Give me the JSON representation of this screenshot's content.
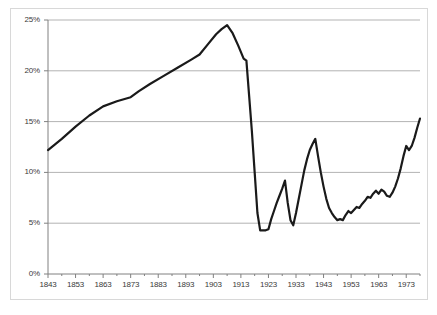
{
  "chart_data": {
    "type": "line",
    "title": "",
    "subtitle": "",
    "xlabel": "",
    "ylabel": "",
    "xlim": [
      1843,
      1978
    ],
    "ylim": [
      0,
      25
    ],
    "grid": true,
    "grid_axis": "y",
    "legend": false,
    "legend_position": "none",
    "line_color": "#1a1a1a",
    "grid_color": "#b3b3b3",
    "axis_color": "#808080",
    "background_color": "#ffffff",
    "y_ticks": [
      0,
      5,
      10,
      15,
      20,
      25
    ],
    "y_tick_labels": [
      "0%",
      "5%",
      "10%",
      "15%",
      "20%",
      "25%"
    ],
    "x_ticks": [
      1843,
      1853,
      1863,
      1873,
      1883,
      1893,
      1903,
      1913,
      1923,
      1933,
      1943,
      1953,
      1963,
      1973
    ],
    "x_tick_labels": [
      "1843",
      "1853",
      "1863",
      "1873",
      "1883",
      "1893",
      "1903",
      "1913",
      "1923",
      "1933",
      "1943",
      "1953",
      "1963",
      "1973"
    ],
    "x_minor_tick_interval": 5,
    "series": [
      {
        "name": "share",
        "x": [
          1843,
          1848,
          1853,
          1858,
          1863,
          1868,
          1873,
          1876,
          1880,
          1885,
          1890,
          1895,
          1898,
          1901,
          1904,
          1906,
          1908,
          1910,
          1912,
          1914,
          1915,
          1916,
          1917,
          1918,
          1919,
          1920,
          1921,
          1922,
          1923,
          1924,
          1925,
          1926,
          1927,
          1928,
          1929,
          1930,
          1931,
          1932,
          1933,
          1934,
          1935,
          1936,
          1937,
          1938,
          1939,
          1940,
          1941,
          1942,
          1943,
          1944,
          1945,
          1946,
          1947,
          1948,
          1949,
          1950,
          1951,
          1952,
          1953,
          1954,
          1955,
          1956,
          1957,
          1958,
          1959,
          1960,
          1961,
          1962,
          1963,
          1964,
          1965,
          1966,
          1967,
          1968,
          1969,
          1970,
          1971,
          1972,
          1973,
          1974,
          1975,
          1976,
          1977,
          1978
        ],
        "y": [
          12.2,
          13.3,
          14.5,
          15.6,
          16.5,
          17.0,
          17.4,
          18.0,
          18.7,
          19.5,
          20.3,
          21.1,
          21.6,
          22.6,
          23.6,
          24.1,
          24.5,
          23.7,
          22.5,
          21.2,
          21.0,
          17.5,
          14.0,
          10.0,
          6.0,
          4.3,
          4.3,
          4.3,
          4.4,
          5.4,
          6.2,
          7.0,
          7.7,
          8.4,
          9.2,
          7.0,
          5.3,
          4.8,
          6.0,
          7.4,
          8.8,
          10.2,
          11.3,
          12.2,
          12.8,
          13.3,
          11.6,
          10.0,
          8.6,
          7.4,
          6.5,
          6.0,
          5.6,
          5.3,
          5.4,
          5.3,
          5.8,
          6.2,
          6.0,
          6.3,
          6.6,
          6.5,
          6.9,
          7.2,
          7.6,
          7.5,
          7.9,
          8.2,
          7.9,
          8.3,
          8.1,
          7.7,
          7.6,
          8.0,
          8.6,
          9.4,
          10.4,
          11.6,
          12.6,
          12.2,
          12.6,
          13.4,
          14.4,
          15.3
        ],
        "units": "percent"
      }
    ]
  },
  "axis": {
    "y_title": "",
    "x_title": ""
  }
}
